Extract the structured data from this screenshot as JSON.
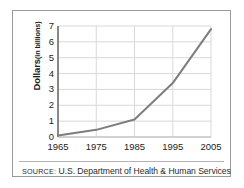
{
  "figure": {
    "source_kicker": "SOURCE:",
    "source_text": "U.S. Department of Health & Human Services",
    "frame_color": "#9a9a9a",
    "background": "#ffffff"
  },
  "chart_data": {
    "type": "line",
    "title": "",
    "xlabel": "",
    "ylabel": "Dollars",
    "ylabel_unit": "(in billions)",
    "x": [
      1965,
      1975,
      1985,
      1995,
      2005
    ],
    "values": [
      0.1,
      0.45,
      1.1,
      3.4,
      6.8
    ],
    "categories": [
      "1965",
      "1975",
      "1985",
      "1995",
      "2005"
    ],
    "xticklabels": [
      "1965",
      "1975",
      "1985",
      "1995",
      "2005"
    ],
    "yticklabels": [
      "0",
      "1",
      "2",
      "3",
      "4",
      "5",
      "6",
      "7"
    ],
    "yticks": [
      0,
      1,
      2,
      3,
      4,
      5,
      6,
      7
    ],
    "xlim": [
      1965,
      2005
    ],
    "ylim": [
      0,
      7
    ],
    "grid": true,
    "grid_color": "#d8d8d8",
    "axis_color": "#6f6f6f",
    "line_color": "#7d7d7d",
    "line_width": 2,
    "legend": false,
    "legend_position": "none",
    "series": [
      {
        "name": "Dollars (in billions)",
        "values": [
          0.1,
          0.45,
          1.1,
          3.4,
          6.8
        ]
      }
    ]
  }
}
